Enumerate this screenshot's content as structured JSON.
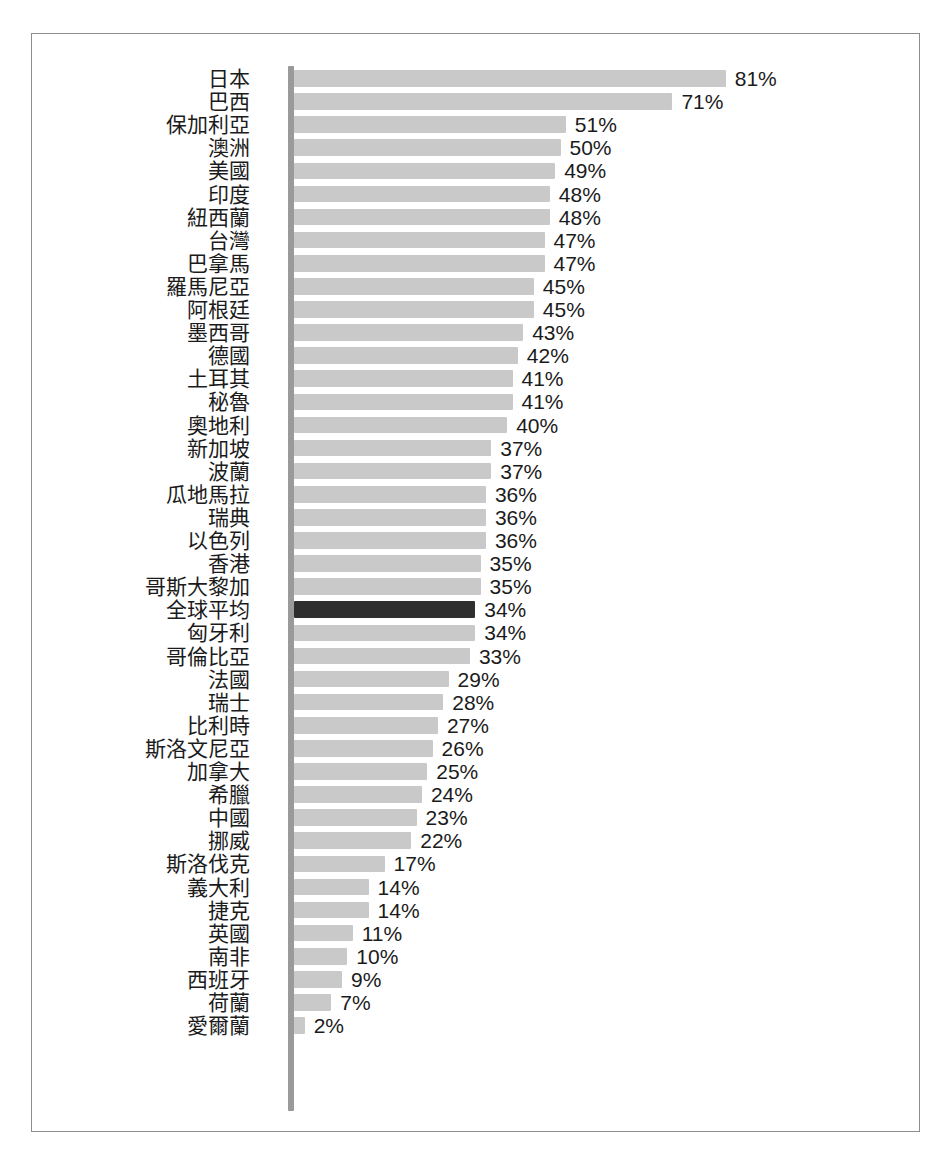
{
  "chart_data": {
    "type": "bar",
    "orientation": "horizontal",
    "title": "",
    "subtitle": "",
    "xlabel": "",
    "ylabel": "",
    "xlim": [
      0,
      81
    ],
    "grid": false,
    "legend": null,
    "value_suffix": "%",
    "highlight_category": "全球平均",
    "colors": {
      "bar": "#c9c9c9",
      "bar_highlight": "#2f2f2f",
      "axis": "#9a9a9a",
      "frame": "#8d8d8d",
      "text": "#1b1b1b",
      "background": "#ffffff"
    },
    "categories": [
      "日本",
      "巴西",
      "保加利亞",
      "澳洲",
      "美國",
      "印度",
      "紐西蘭",
      "台灣",
      "巴拿馬",
      "羅馬尼亞",
      "阿根廷",
      "墨西哥",
      "德國",
      "土耳其",
      "秘魯",
      "奧地利",
      "新加坡",
      "波蘭",
      "瓜地馬拉",
      "瑞典",
      "以色列",
      "香港",
      "哥斯大黎加",
      "全球平均",
      "匈牙利",
      "哥倫比亞",
      "法國",
      "瑞士",
      "比利時",
      "斯洛文尼亞",
      "加拿大",
      "希臘",
      "中國",
      "挪威",
      "斯洛伐克",
      "義大利",
      "捷克",
      "英國",
      "南非",
      "西班牙",
      "荷蘭",
      "愛爾蘭"
    ],
    "values": [
      81,
      71,
      51,
      50,
      49,
      48,
      48,
      47,
      47,
      45,
      45,
      43,
      42,
      41,
      41,
      40,
      37,
      37,
      36,
      36,
      36,
      35,
      35,
      34,
      34,
      33,
      29,
      28,
      27,
      26,
      25,
      24,
      23,
      22,
      17,
      14,
      14,
      11,
      10,
      9,
      7,
      2
    ],
    "value_labels": [
      "81%",
      "71%",
      "51%",
      "50%",
      "49%",
      "48%",
      "48%",
      "47%",
      "47%",
      "45%",
      "45%",
      "43%",
      "42%",
      "41%",
      "41%",
      "40%",
      "37%",
      "37%",
      "36%",
      "36%",
      "36%",
      "35%",
      "35%",
      "34%",
      "34%",
      "33%",
      "29%",
      "28%",
      "27%",
      "26%",
      "25%",
      "24%",
      "23%",
      "22%",
      "17%",
      "14%",
      "14%",
      "11%",
      "10%",
      "9%",
      "7%",
      "2%"
    ]
  }
}
